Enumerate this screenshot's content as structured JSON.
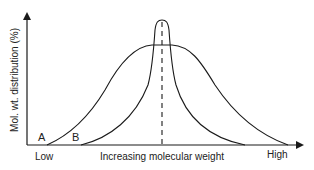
{
  "diagram": {
    "type": "molecular-weight-distribution",
    "y_axis_label": "Mol. wt. distribution (%)",
    "x_axis_label": "Increasing molecular weight",
    "x_axis_low": "Low",
    "x_axis_high": "High",
    "curves": [
      {
        "name": "A",
        "label": "A",
        "shape": "broad distribution, flat-topped peak"
      },
      {
        "name": "B",
        "label": "B",
        "shape": "narrow distribution, sharp tall peak"
      }
    ],
    "peak_marker": "dashed vertical line at common peak molecular weight",
    "colors": {
      "line": "#1a1a1a",
      "background": "#ffffff"
    }
  }
}
